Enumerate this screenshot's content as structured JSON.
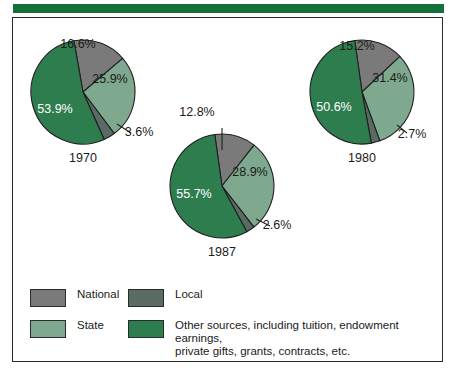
{
  "figure": {
    "accent_color": "#14713c",
    "border_color": "#2b2b2b",
    "background": "#ffffff"
  },
  "colors": {
    "national": "#7a7a7a",
    "local": "#5a6b63",
    "state": "#7fa98e",
    "other": "#2e7d4f",
    "slice_outline": "#1f1f1f",
    "label_dark": "#1a1a1a",
    "label_light": "#ffffff"
  },
  "legend": {
    "items": [
      {
        "label": "National",
        "color_key": "national",
        "color": "#7a7a7a"
      },
      {
        "label": "Local",
        "color_key": "local",
        "color": "#5a6b63"
      },
      {
        "label": "State",
        "color_key": "state",
        "color": "#7fa98e"
      },
      {
        "label": "Other sources, including tuition, endowment earnings,\nprivate gifts, grants, contracts, etc.",
        "color_key": "other",
        "color": "#2e7d4f"
      }
    ]
  },
  "chart_data": {
    "type": "pie",
    "title": "",
    "subtitle": "",
    "legend_position": "bottom",
    "grid": false,
    "categories": [
      "National",
      "State",
      "Local",
      "Other sources, including tuition, endowment earnings, private gifts, grants, contracts, etc."
    ],
    "category_colors": [
      "#7a7a7a",
      "#7fa98e",
      "#5a6b63",
      "#2e7d4f"
    ],
    "value_unit": "%",
    "charts": [
      {
        "name": "1970",
        "label": "1970",
        "center": [
          83,
          92
        ],
        "radius": 52,
        "start_angle": -10,
        "slices": [
          {
            "category": "National",
            "value": 16.6,
            "label": "16.6%",
            "color": "#7a7a7a",
            "label_pos": "inside",
            "label_xy": [
              78,
              48
            ],
            "label_color": "#1a1a1a"
          },
          {
            "category": "State",
            "value": 25.9,
            "label": "25.9%",
            "color": "#7fa98e",
            "label_pos": "inside",
            "label_xy": [
              110,
              83
            ],
            "label_color": "#1a1a1a"
          },
          {
            "category": "Local",
            "value": 3.6,
            "label": "3.6%",
            "color": "#5a6b63",
            "label_pos": "outside",
            "label_xy": [
              139,
              136
            ],
            "label_color": "#1a1a1a",
            "leader": [
              [
                117,
                124
              ],
              [
                131,
                133
              ]
            ]
          },
          {
            "category": "Other sources, including tuition, endowment earnings, private gifts, grants, contracts, etc.",
            "value": 53.9,
            "label": "53.9%",
            "color": "#2e7d4f",
            "label_pos": "inside",
            "label_xy": [
              55,
              113
            ],
            "label_color": "#ffffff"
          }
        ]
      },
      {
        "name": "1987",
        "label": "1987",
        "center": [
          222,
          186
        ],
        "radius": 52,
        "start_angle": -8,
        "slices": [
          {
            "category": "National",
            "value": 12.8,
            "label": "12.8%",
            "color": "#7a7a7a",
            "label_pos": "outside",
            "label_xy": [
              197,
              116
            ],
            "label_color": "#1a1a1a",
            "leader": [
              [
                222,
                150
              ],
              [
                222,
                128
              ]
            ]
          },
          {
            "category": "State",
            "value": 28.9,
            "label": "28.9%",
            "color": "#7fa98e",
            "label_pos": "inside",
            "label_xy": [
              250,
              176
            ],
            "label_color": "#1a1a1a"
          },
          {
            "category": "Local",
            "value": 2.6,
            "label": "2.6%",
            "color": "#5a6b63",
            "label_pos": "outside",
            "label_xy": [
              277,
              229
            ],
            "label_color": "#1a1a1a",
            "leader": [
              [
                256,
                219
              ],
              [
                270,
                226
              ]
            ]
          },
          {
            "category": "Other sources, including tuition, endowment earnings, private gifts, grants, contracts, etc.",
            "value": 55.7,
            "label": "55.7%",
            "color": "#2e7d4f",
            "label_pos": "inside",
            "label_xy": [
              194,
              198
            ],
            "label_color": "#ffffff"
          }
        ]
      },
      {
        "name": "1980",
        "label": "1980",
        "center": [
          362,
          92
        ],
        "radius": 52,
        "start_angle": -8,
        "slices": [
          {
            "category": "National",
            "value": 15.2,
            "label": "15.2%",
            "color": "#7a7a7a",
            "label_pos": "inside",
            "label_xy": [
              357,
              50
            ],
            "label_color": "#1a1a1a"
          },
          {
            "category": "State",
            "value": 31.4,
            "label": "31.4%",
            "color": "#7fa98e",
            "label_pos": "inside",
            "label_xy": [
              390,
              82
            ],
            "label_color": "#1a1a1a"
          },
          {
            "category": "Local",
            "value": 2.7,
            "label": "2.7%",
            "color": "#5a6b63",
            "label_pos": "outside",
            "label_xy": [
              412,
              138
            ],
            "label_color": "#1a1a1a",
            "leader": [
              [
                397,
                125
              ],
              [
                407,
                133
              ]
            ]
          },
          {
            "category": "Other sources, including tuition, endowment earnings, private gifts, grants, contracts, etc.",
            "value": 50.6,
            "label": "50.6%",
            "color": "#2e7d4f",
            "label_pos": "inside",
            "label_xy": [
              334,
              111
            ],
            "label_color": "#ffffff"
          }
        ]
      }
    ]
  }
}
